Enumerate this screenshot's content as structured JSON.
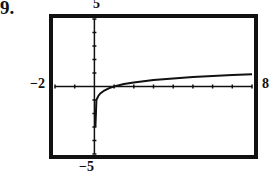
{
  "problem": {
    "number": "9."
  },
  "window": {
    "xmin_label": "−2",
    "xmax_label": "8",
    "ymin_label": "−5",
    "ymax_label": "5"
  },
  "chart_data": {
    "type": "line",
    "title": "",
    "xlabel": "",
    "ylabel": "",
    "xlim": [
      -2,
      8
    ],
    "ylim": [
      -5,
      5
    ],
    "grid": false,
    "legend": null,
    "x_ticks_per_unit": 1,
    "y_ticks_per_unit": 1,
    "annotations": [
      "9.",
      "−2",
      "8",
      "5",
      "−5"
    ],
    "series": [
      {
        "name": "f(x)",
        "x": [
          0.05,
          0.1,
          0.2,
          0.3,
          0.5,
          0.75,
          1,
          1.5,
          2,
          3,
          4,
          5,
          6,
          7,
          8
        ],
        "y": [
          -3.0,
          -1.0,
          -0.7,
          -0.52,
          -0.3,
          -0.12,
          0,
          0.18,
          0.3,
          0.48,
          0.6,
          0.7,
          0.78,
          0.85,
          0.9
        ]
      }
    ]
  }
}
